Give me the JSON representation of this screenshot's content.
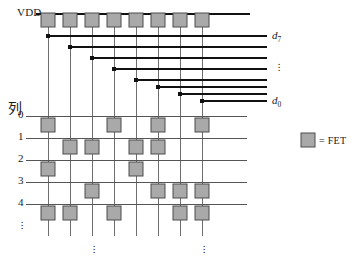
{
  "diagram": {
    "power_rail_label": "VDD",
    "row_axis_label": "列",
    "row_labels": [
      "0",
      "1",
      "2",
      "3",
      "4"
    ],
    "row_continuation": "⋮",
    "column_continuation": "⋮",
    "data_line_labels": {
      "top": "d",
      "top_sub": "7",
      "bottom": "d",
      "bottom_sub": "0",
      "middle_continuation": "⋮"
    },
    "legend": {
      "symbol_name": "fet-square",
      "text": "= FET"
    },
    "colors": {
      "fet_fill": "#a9a9a9",
      "fet_stroke": "#4d4d4d",
      "wire": "#6e6e6e",
      "bold_wire": "#111111",
      "text": "#1a1a1a",
      "background": "#ffffff"
    },
    "geometry": {
      "columns": 8,
      "rows": 5,
      "data_lines": 8,
      "pullup_fets": 8,
      "column_x": [
        48,
        70,
        92,
        114,
        136,
        158,
        180,
        202
      ],
      "grid_row_y": [
        116,
        138,
        160,
        182,
        204
      ],
      "data_line_y": [
        36,
        47,
        58,
        69,
        80,
        87,
        94,
        101
      ],
      "vdd_rail_y": 14,
      "pullup_fet_y": 20,
      "fet_size": 14,
      "grid_left": 26,
      "grid_right": 247,
      "vertical_line_top": 20,
      "vertical_line_bottom": 236
    },
    "fet_matrix": [
      {
        "row": "0",
        "columns": [
          0,
          3,
          5,
          7
        ]
      },
      {
        "row": "1",
        "columns": [
          1,
          2,
          4,
          5
        ]
      },
      {
        "row": "2",
        "columns": [
          0,
          4
        ]
      },
      {
        "row": "3",
        "columns": [
          2,
          5,
          6,
          7
        ]
      },
      {
        "row": "4",
        "columns": [
          0,
          1,
          3,
          6,
          7
        ]
      }
    ],
    "data_line_taps": [
      {
        "line": "d7",
        "start_column": 0
      },
      {
        "line": "d6",
        "start_column": 1
      },
      {
        "line": "d5",
        "start_column": 2
      },
      {
        "line": "d4",
        "start_column": 3
      },
      {
        "line": "d3",
        "start_column": 4
      },
      {
        "line": "d2",
        "start_column": 5
      },
      {
        "line": "d1",
        "start_column": 6
      },
      {
        "line": "d0",
        "start_column": 7
      }
    ]
  }
}
